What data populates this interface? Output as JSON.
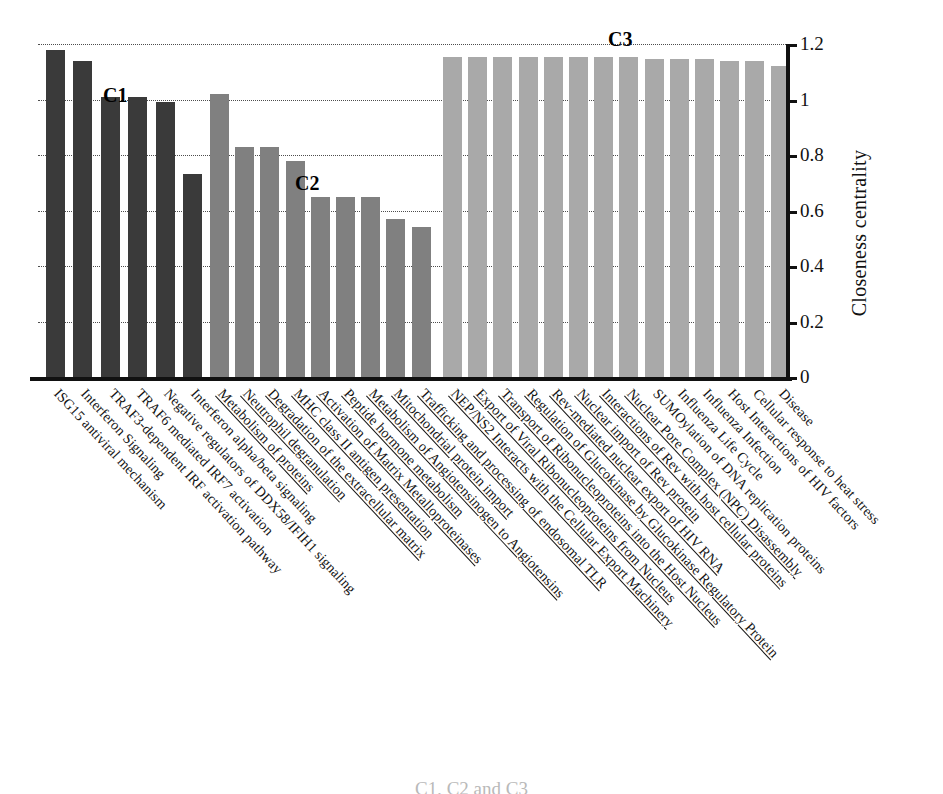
{
  "chart_data": {
    "type": "bar",
    "title": "",
    "xlabel": "",
    "ylabel": "Closeness centrality",
    "ylim": [
      0,
      1.2
    ],
    "yticks": [
      "0",
      "0.2",
      "0.4",
      "0.6",
      "0.8",
      "1",
      "1.2"
    ],
    "grid": true,
    "legend": "none",
    "annotations": [
      {
        "text": "C1",
        "cluster": 1
      },
      {
        "text": "C2",
        "cluster": 2
      },
      {
        "text": "C3",
        "cluster": 3
      }
    ],
    "clusters": [
      {
        "name": "C1",
        "color": "#3a3a3a",
        "categories": [
          "ISG15 antiviral mechanism",
          "Interferon Signaling",
          "TRAF3-dependent IRF activation pathway",
          "TRAF6 mediated IRF7 activation",
          "Negative regulators of DDX58/IFIH1 signaling",
          "Interferon alpha/beta signaling"
        ],
        "values": [
          1.18,
          1.14,
          1.01,
          1.01,
          0.99,
          0.73
        ]
      },
      {
        "name": "C2",
        "color": "#808080",
        "categories": [
          "Metabolism of proteins",
          "Neutrophil degranulation",
          "Degradation of the extracellular matrix",
          "MHC class II antigen presentation",
          "Activation of Matrix Metalloproteinases",
          "Peptide hormone metabolism",
          "Metabolism of Angiotensinogen to Angiotensins",
          "Mitochondrial protein import",
          "Trafficking and processing of endosomal TLR"
        ],
        "values": [
          1.02,
          0.83,
          0.83,
          0.78,
          0.65,
          0.65,
          0.65,
          0.57,
          0.54
        ]
      },
      {
        "name": "C3",
        "color": "#a9a9a9",
        "categories": [
          "NEP/NS2 Interacts with the Cellular Export Machinery",
          "Export of Viral Ribonucleoproteins from Nucleus",
          "Transport of Ribonucleoproteins into the Host Nucleus",
          "Regulation of Glucokinase by Glucokinase Regulatory Protein",
          "Rev-mediated nuclear export of HIV RNA",
          "Nuclear import of Rev protein",
          "Interactions of Rev with host cellular proteins",
          "Nuclear Pore Complex (NPC) Disassembly",
          "SUMOylation of DNA replication proteins",
          "Influenza Life Cycle",
          "Influenza Infection",
          "Host Interactions of HIV factors",
          "Cellular response to heat stress",
          "Disease"
        ],
        "values": [
          1.155,
          1.155,
          1.155,
          1.155,
          1.155,
          1.155,
          1.155,
          1.155,
          1.145,
          1.145,
          1.145,
          1.14,
          1.14,
          1.12
        ]
      }
    ]
  },
  "caption": "C1, C2 and C3"
}
